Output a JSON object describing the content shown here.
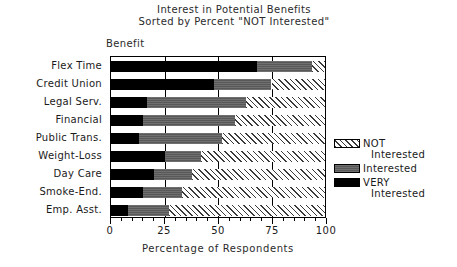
{
  "chart_data": {
    "type": "bar",
    "orientation": "horizontal",
    "stacked": true,
    "stacked_mode": "percent",
    "title": "Interest in Potential Benefits",
    "subtitle": "Sorted by Percent \"NOT Interested\"",
    "ylabel": "Benefit",
    "xlabel": "Percentage of Respondents",
    "xlim": [
      0,
      100
    ],
    "xticks": [
      0,
      25,
      50,
      75,
      100
    ],
    "xticklabels": [
      "0",
      "25",
      "50",
      "75",
      "100"
    ],
    "grid": true,
    "legend_position": "right",
    "categories": [
      "Flex Time",
      "Credit Union",
      "Legal Serv.",
      "Financial",
      "Public Trans.",
      "Weight-Loss",
      "Day Care",
      "Smoke-End.",
      "Emp. Asst."
    ],
    "series": [
      {
        "name": "VERY Interested",
        "legend_line1": "VERY",
        "legend_line2": "Interested",
        "fill": "solid-black",
        "color": "#000000",
        "values": [
          68,
          48,
          17,
          15,
          13,
          25,
          20,
          15,
          8
        ]
      },
      {
        "name": "Interested",
        "legend_line1": "Interested",
        "legend_line2": "",
        "fill": "solid-gray",
        "color": "#585858",
        "values": [
          26,
          27,
          46,
          43,
          39,
          17,
          18,
          18,
          19
        ]
      },
      {
        "name": "NOT Interested",
        "legend_line1": "NOT",
        "legend_line2": "Interested",
        "fill": "diagonal-hatch",
        "color": "#ffffff",
        "values": [
          6,
          25,
          37,
          42,
          48,
          58,
          62,
          67,
          73
        ]
      }
    ]
  }
}
